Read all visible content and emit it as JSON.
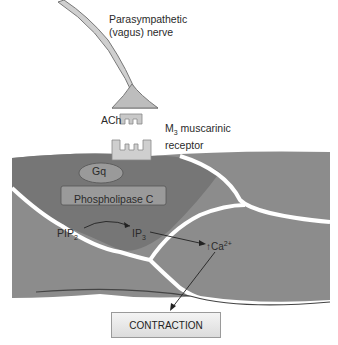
{
  "diagram": {
    "labels": {
      "nerve_line1": "Parasympathetic",
      "nerve_line2": "(vagus) nerve",
      "ach": "ACh",
      "m3_prefix": "M",
      "m3_sub": "3",
      "m3_suffix": " muscarinic",
      "m3_line2": "receptor",
      "gq": "Gq",
      "plc": "Phospholipase C",
      "pip": "PIP",
      "pip_sub": "2",
      "ip": "IP",
      "ip_sub": "3",
      "ca_prefix": "↑Ca",
      "ca_sup": "2+",
      "contraction": "CONTRACTION"
    },
    "colors": {
      "cell_fill": "#8a8a8a",
      "cell_dark": "#6e6e6e",
      "receptor_fill": "#c8c8c8",
      "terminal_fill": "#bdbdbd",
      "box_fill": "#9a9a9a"
    }
  }
}
